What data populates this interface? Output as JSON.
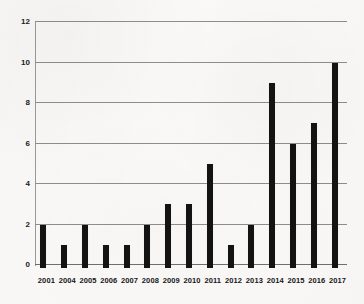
{
  "chart_data": {
    "type": "bar",
    "title": "",
    "subtitle": "",
    "xlabel": "",
    "ylabel": "",
    "categories": [
      "2001",
      "2004",
      "2005",
      "2006",
      "2007",
      "2008",
      "2009",
      "2010",
      "2011",
      "2012",
      "2013",
      "2014",
      "2015",
      "2016",
      "2017"
    ],
    "values": [
      2,
      1,
      2,
      1,
      1,
      2,
      3,
      3,
      5,
      1,
      2,
      9,
      6,
      7,
      10
    ],
    "ylim": [
      0,
      12
    ],
    "ytick_labels": [
      "0",
      "2",
      "4",
      "6",
      "8",
      "10",
      "12"
    ],
    "ytick_values": [
      0,
      2,
      4,
      6,
      8,
      10,
      12
    ],
    "grid": true,
    "legend": "none",
    "bar_color": "#131313",
    "gridline_color": "#8e8e8e",
    "background_color": "#faf9f7"
  }
}
